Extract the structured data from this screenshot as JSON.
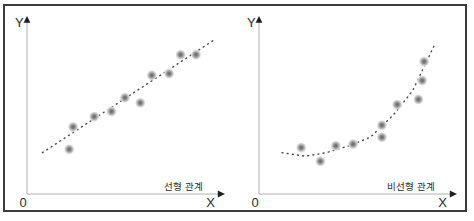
{
  "style": {
    "frame_border_color": "#3c3c3c",
    "background": "#ffffff",
    "axis_color": "#b0b0b0",
    "arrow_color": "#1f1f1f",
    "label_color": "#2b2b2b",
    "trend_dot_color": "#4a4a4a",
    "marker_core_color": "#6e6e6e",
    "marker_halo_color": "#d9d9d9"
  },
  "chart_data": [
    {
      "type": "scatter",
      "title": "선형 관계",
      "xlabel": "X",
      "ylabel": "Y",
      "origin_label": "0",
      "grid": false,
      "axis_arrows": true,
      "xlim": [
        0,
        100
      ],
      "ylim": [
        0,
        100
      ],
      "points": [
        [
          22,
          26
        ],
        [
          24,
          39
        ],
        [
          35,
          45
        ],
        [
          44,
          48
        ],
        [
          51,
          56
        ],
        [
          59,
          53
        ],
        [
          65,
          69
        ],
        [
          74,
          70
        ],
        [
          80,
          81
        ],
        [
          88,
          81
        ]
      ],
      "trend": {
        "shape": "linear",
        "style": "dotted",
        "points": [
          [
            8,
            24
          ],
          [
            98,
            90
          ]
        ]
      }
    },
    {
      "type": "scatter",
      "title": "비선형 관계",
      "xlabel": "X",
      "ylabel": "Y",
      "origin_label": "0",
      "grid": false,
      "axis_arrows": true,
      "xlim": [
        0,
        100
      ],
      "ylim": [
        0,
        100
      ],
      "points": [
        [
          22,
          27
        ],
        [
          32,
          19
        ],
        [
          40,
          28
        ],
        [
          49,
          29
        ],
        [
          64,
          33
        ],
        [
          64,
          40
        ],
        [
          72,
          52
        ],
        [
          83,
          55
        ],
        [
          85,
          66
        ],
        [
          86,
          77
        ]
      ],
      "trend": {
        "shape": "curved",
        "style": "dotted",
        "points": [
          [
            12,
            24
          ],
          [
            24,
            22
          ],
          [
            35,
            24
          ],
          [
            47,
            28
          ],
          [
            58,
            33
          ],
          [
            70,
            46
          ],
          [
            80,
            60
          ],
          [
            92,
            88
          ]
        ]
      }
    }
  ]
}
